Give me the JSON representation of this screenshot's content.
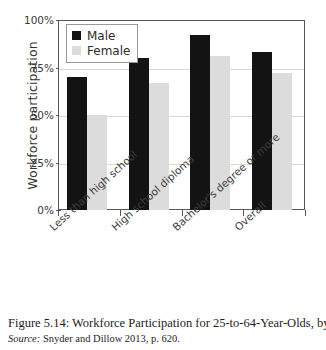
{
  "chart_data": {
    "type": "bar",
    "title": "",
    "xlabel": "",
    "ylabel": "Workforce participation",
    "ylim": [
      0,
      100
    ],
    "ytick_labels": [
      "100%",
      "75%",
      "50%",
      "25%",
      "0%"
    ],
    "ytick_values": [
      100,
      75,
      50,
      25,
      0
    ],
    "grid": true,
    "legend_position": "top-left",
    "categories": [
      "Less than high school",
      "High school diploma",
      "Bachelor's degree or more",
      "Overall"
    ],
    "series": [
      {
        "name": "Male",
        "color": "#131313",
        "values": [
          70,
          80,
          92,
          83
        ]
      },
      {
        "name": "Female",
        "color": "#dcdcdc",
        "values": [
          50,
          67,
          81,
          72
        ]
      }
    ]
  },
  "legend": {
    "items": [
      {
        "label": "Male",
        "swatch": "male"
      },
      {
        "label": "Female",
        "swatch": "female"
      }
    ]
  },
  "caption": {
    "main": "Figure 5.14: Workforce Participation for 25-to-64-Year-Olds, by E",
    "source_label": "Source:",
    "source_text": " Snyder and Dillow 2013, p. 620."
  }
}
